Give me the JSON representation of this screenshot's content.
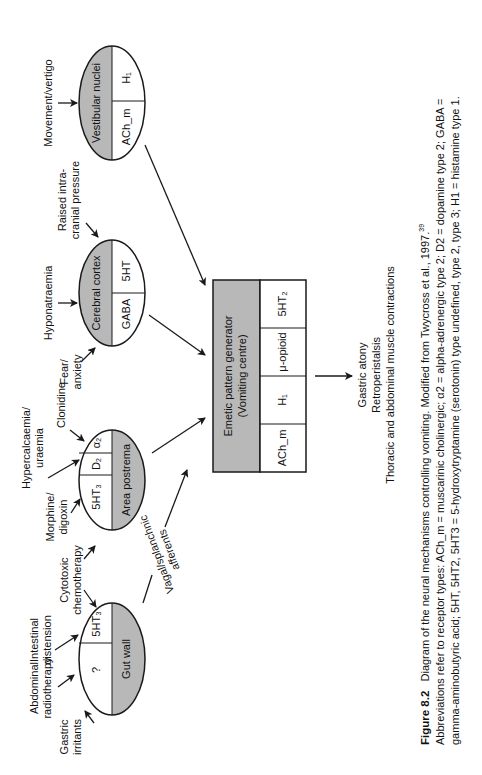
{
  "figure": {
    "number": "Figure 8.2",
    "title": "Diagram of the neural mechanisms controlling vomiting. Modified from Twycross et al., 1997.",
    "reference_superscript": "39",
    "caption_lines": [
      "Abbreviations refer to receptor types: ACh_m = muscarinic cholinergic; α2 = alpha-adrenergic type 2; D2 = dopamine type 2; GABA =",
      "gamma-aminobutyric acid; 5HT, 5HT2, 5HT3 = 5-hydroxytryptamine (serotonin) type undefined, type 2, type 3; H1 = histamine type 1."
    ]
  },
  "nodes": {
    "gut_wall": {
      "label": "Gut wall",
      "receptors": [
        "?",
        "5HT₃"
      ]
    },
    "area_postrema": {
      "label": "Area postrema",
      "receptors": [
        "5HT₃",
        "D₂",
        "α₂"
      ]
    },
    "cerebral_cortex": {
      "label": "Cerebral cortex",
      "receptors": [
        "GABA",
        "5HT"
      ]
    },
    "vestibular_nuclei": {
      "label": "Vestibular nuclei",
      "receptors": [
        "ACh_m",
        "H₁"
      ]
    },
    "emetic_centre": {
      "label_line1": "Emetic pattern generator",
      "label_line2": "(Vomiting centre)",
      "receptors": [
        "ACh_m",
        "H₁",
        "μ-opioid",
        "5HT₂"
      ]
    }
  },
  "stimuli": {
    "gastric_irritants": [
      "Gastric",
      "irritants"
    ],
    "abdominal_radiotherapy": [
      "Abdominal",
      "radiotherapy"
    ],
    "intestinal_distension": [
      "Intestinal",
      "distension"
    ],
    "cytotoxic_chemotherapy": [
      "Cytotoxic",
      "chemotherapy"
    ],
    "morphine_digoxin": [
      "Morphine/",
      "digoxin"
    ],
    "hypercalcaemia_uraemia": [
      "Hypercalcaemia/",
      "uraemia"
    ],
    "clonidine": [
      "Clonidine"
    ],
    "fear_anxiety": [
      "Fear/",
      "anxiety"
    ],
    "hyponatraemia": [
      "Hyponatraemia"
    ],
    "raised_icp": [
      "Raised intra-",
      "cranial pressure"
    ],
    "movement_vertigo": [
      "Movement/vertigo"
    ]
  },
  "pathway_label": [
    "Vagal/splanchnic",
    "afferents"
  ],
  "outcomes": [
    "Gastric atony",
    "Retroperistalsis",
    "Thoracic and abdominal muscle contractions"
  ],
  "colors": {
    "shade": "#b8b8b8",
    "line": "#1a1a1a",
    "background": "#ffffff"
  }
}
